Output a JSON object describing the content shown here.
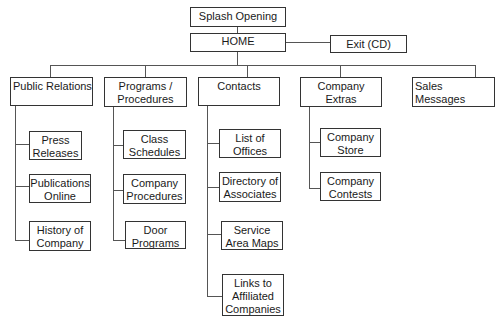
{
  "diagram": {
    "type": "site-map",
    "top": [
      {
        "id": "splash",
        "label": "Splash Opening"
      },
      {
        "id": "home",
        "label": "HOME"
      },
      {
        "id": "exit",
        "label": "Exit (CD)"
      }
    ],
    "sections": [
      {
        "id": "public-relations",
        "label": "Public Relations",
        "children": [
          "Press Releases",
          "Publications Online",
          "History of Company"
        ]
      },
      {
        "id": "programs",
        "label": "Programs / Procedures",
        "children": [
          "Class Schedules",
          "Company Procedures",
          "Door Programs"
        ]
      },
      {
        "id": "contacts",
        "label": "Contacts",
        "children": [
          "List of Offices",
          "Directory of Associates",
          "Service Area Maps",
          "Links to Affiliated Companies"
        ]
      },
      {
        "id": "company-extras",
        "label": "Company Extras",
        "children": [
          "Company Store",
          "Company Contests"
        ]
      },
      {
        "id": "sales-messages",
        "label": "Sales Messages",
        "children": []
      }
    ]
  },
  "labels": {
    "splash": "Splash Opening",
    "home": "HOME",
    "exit": "Exit (CD)",
    "pr": "Public Relations",
    "prog1": "Programs /",
    "prog2": "Procedures",
    "contacts": "Contacts",
    "extras1": "Company",
    "extras2": "Extras",
    "sales": "Sales Messages",
    "press1": "Press",
    "press2": "Releases",
    "pub1": "Publications",
    "pub2": "Online",
    "hist1": "History of",
    "hist2": "Company",
    "class1": "Class",
    "class2": "Schedules",
    "proc1": "Company",
    "proc2": "Procedures",
    "door1": "Door",
    "door2": "Programs",
    "list1": "List of",
    "list2": "Offices",
    "dir1": "Directory of",
    "dir2": "Associates",
    "svc1": "Service",
    "svc2": "Area Maps",
    "links1": "Links to",
    "links2": "Affiliated",
    "links3": "Companies",
    "store1": "Company",
    "store2": "Store",
    "contests1": "Company",
    "contests2": "Contests"
  }
}
